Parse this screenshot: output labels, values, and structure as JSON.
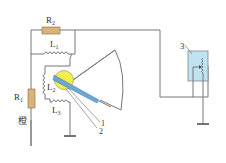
{
  "diagram": {
    "type": "circuit",
    "labels": {
      "r2": "R",
      "r2_sub": "2",
      "l1": "L",
      "l1_sub": "1",
      "l2": "L",
      "l2_sub": "2",
      "l3": "L",
      "l3_sub": "3",
      "r1": "R",
      "r1_sub": "1",
      "r1_note": "橙",
      "pointer_label_1": "1",
      "pointer_label_2": "2",
      "sensor_label": "3"
    },
    "colors": {
      "resistor_fill": "#d9b47a",
      "rotor_fill": "#f4ee4a",
      "pointer_fill": "#6aa6d6",
      "sensor_fill": "#bfe3f0",
      "wire": "#777777"
    }
  }
}
